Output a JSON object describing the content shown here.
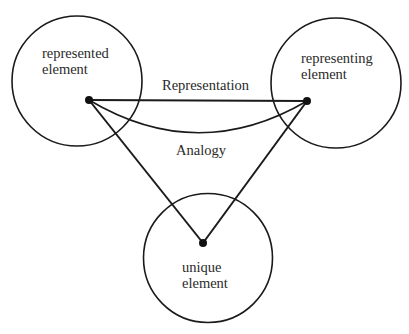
{
  "caption": "g... ...    ...p...   ...-...  ...-...ing element",
  "nodes": {
    "represented": {
      "line1": "represented",
      "line2": "element"
    },
    "representing": {
      "line1": "representing",
      "line2": "element"
    },
    "unique": {
      "line1": "unique",
      "line2": "element"
    }
  },
  "edges": {
    "representation": "Representation",
    "analogy": "Analogy"
  },
  "colors": {
    "stroke": "#1a1a1a",
    "text": "#2a2a2a",
    "background": "#ffffff"
  }
}
